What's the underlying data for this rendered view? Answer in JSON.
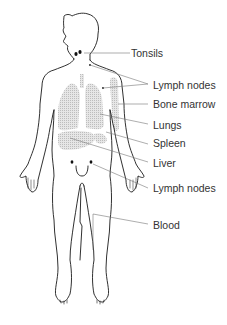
{
  "diagram": {
    "colors": {
      "outline": "#1a1a1a",
      "organ_fill": "#d9d9d9",
      "leader_line": "#777777",
      "marker": "#111111",
      "text": "#333333"
    },
    "labels": [
      {
        "id": "tonsils",
        "text": "Tonsils",
        "x": 131,
        "y": 47
      },
      {
        "id": "lymph-nodes-upper",
        "text": "Lymph nodes",
        "x": 153,
        "y": 79
      },
      {
        "id": "bone-marrow",
        "text": "Bone marrow",
        "x": 153,
        "y": 98
      },
      {
        "id": "lungs",
        "text": "Lungs",
        "x": 153,
        "y": 119
      },
      {
        "id": "spleen",
        "text": "Spleen",
        "x": 153,
        "y": 137
      },
      {
        "id": "liver",
        "text": "Liver",
        "x": 153,
        "y": 157
      },
      {
        "id": "lymph-nodes-lower",
        "text": "Lymph nodes",
        "x": 153,
        "y": 182
      },
      {
        "id": "blood",
        "text": "Blood",
        "x": 153,
        "y": 219
      }
    ]
  }
}
